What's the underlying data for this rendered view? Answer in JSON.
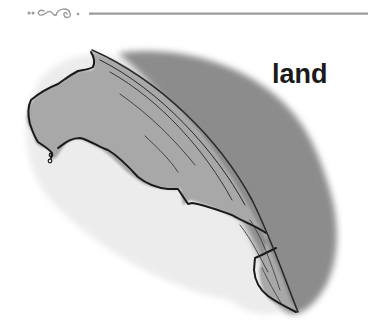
{
  "heading": {
    "text": "land"
  },
  "colors": {
    "ink": "#1a1a1a",
    "ocean": "#8a8a8a",
    "land": "#a6a6a6",
    "shore": "#ededed",
    "divider": "#9a9a9a"
  },
  "illustration": {
    "subject": "hand-drawn land coastline meeting ocean horizon",
    "style": "grayscale watercolor sketch"
  }
}
